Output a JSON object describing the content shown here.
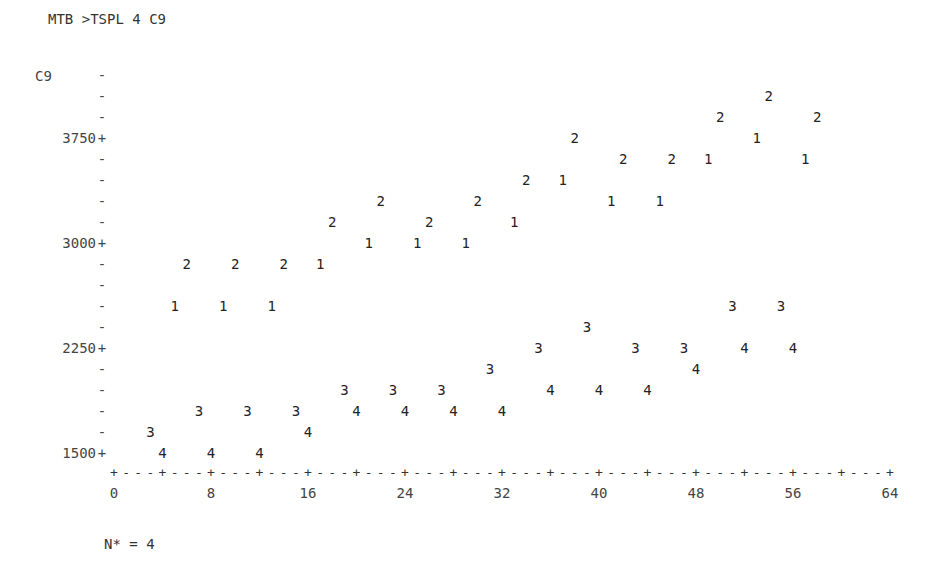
{
  "command": "MTB >TSPL 4 C9",
  "missing_label": "N* = 4",
  "chart_data": {
    "type": "scatter",
    "title": "",
    "subtitle": "Minitab character time series plot, period 4 (symbols 1-4 mark season)",
    "xlabel": "",
    "ylabel": "C9",
    "xlim": [
      0,
      64
    ],
    "ylim": [
      1500,
      4200
    ],
    "y_row_step": 150,
    "x_ticks": [
      0,
      8,
      16,
      24,
      32,
      40,
      48,
      56,
      64
    ],
    "x_minor_step": 4,
    "y_labeled_ticks": [
      1500,
      2250,
      3000,
      3750
    ],
    "grid": false,
    "legend": "none",
    "missing_count": 4,
    "series": [
      {
        "name": "1",
        "symbol": "1",
        "x": [
          5,
          9,
          13,
          17,
          21,
          25,
          29,
          33,
          37,
          41,
          45,
          49,
          53,
          57
        ],
        "y": [
          2550,
          2550,
          2550,
          2850,
          3000,
          3000,
          3000,
          3150,
          3450,
          3300,
          3300,
          3600,
          3750,
          3600
        ]
      },
      {
        "name": "2",
        "symbol": "2",
        "x": [
          6,
          10,
          14,
          18,
          22,
          26,
          30,
          34,
          38,
          42,
          46,
          50,
          54,
          58
        ],
        "y": [
          2850,
          2850,
          2850,
          3150,
          3300,
          3150,
          3300,
          3450,
          3750,
          3600,
          3600,
          3900,
          4050,
          3900
        ]
      },
      {
        "name": "3",
        "symbol": "3",
        "x": [
          3,
          7,
          11,
          15,
          19,
          23,
          27,
          31,
          35,
          39,
          43,
          47,
          51,
          55
        ],
        "y": [
          1650,
          1800,
          1800,
          1800,
          1950,
          1950,
          1950,
          2100,
          2250,
          2400,
          2250,
          2250,
          2550,
          2550
        ]
      },
      {
        "name": "4",
        "symbol": "4",
        "x": [
          4,
          8,
          12,
          16,
          20,
          24,
          28,
          32,
          36,
          40,
          44,
          48,
          52,
          56
        ],
        "y": [
          1500,
          1500,
          1500,
          1650,
          1800,
          1800,
          1800,
          1800,
          1950,
          1950,
          1950,
          2100,
          2250,
          2250
        ]
      }
    ]
  }
}
